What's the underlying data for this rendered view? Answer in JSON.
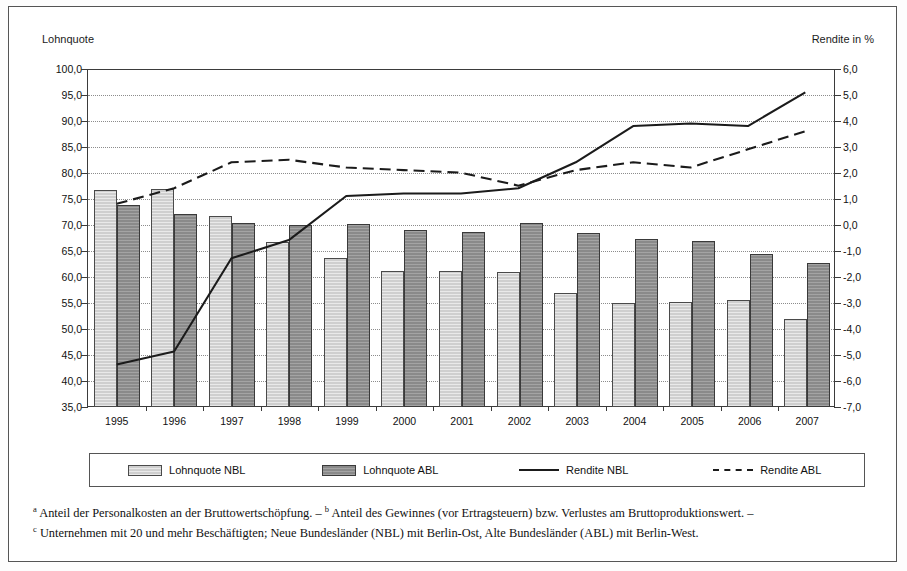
{
  "axis_captions": {
    "left": "Lohnquote",
    "right": "Rendite in %"
  },
  "legend": [
    {
      "label": "Lohnquote NBL",
      "swatch": "bar-light"
    },
    {
      "label": "Lohnquote ABL",
      "swatch": "bar-dark"
    },
    {
      "label": "Rendite NBL",
      "swatch": "line-solid"
    },
    {
      "label": "Rendite ABL",
      "swatch": "line-dashed"
    }
  ],
  "footnotes": [
    "a Anteil der Personalkosten an der Bruttowertschöpfung. – b Anteil des Gewinnes (vor Ertragsteuern) bzw. Verlustes am Bruttoproduktionswert. –",
    "c Unternehmen mit 20 und mehr Beschäftigten; Neue Bundesländer (NBL) mit Berlin-Ost, Alte Bundesländer (ABL) mit Berlin-West."
  ],
  "footnote_parts": [
    {
      "marker": "a",
      "text": " Anteil der Personalkosten an der Bruttowertschöpfung. – ",
      "marker2": "b",
      "text2": " Anteil des Gewinnes (vor Ertragsteuern) bzw. Verlustes am Bruttoproduktionswert. –"
    },
    {
      "marker": "c",
      "text": " Unternehmen mit 20 und mehr Beschäftigten; Neue Bundesländer (NBL) mit Berlin-Ost, Alte Bundesländer (ABL) mit Berlin-West."
    }
  ],
  "colors": {
    "bar_nbl": "#cfcfcf",
    "bar_abl": "#8a8a8a",
    "line": "#1b1b1b",
    "axis": "#3b3b3b",
    "grid": "#8c8c8c"
  },
  "chart_data": {
    "type": "bar",
    "title": "",
    "xlabel": "",
    "ylabel": "Lohnquote",
    "y2label": "Rendite in %",
    "grid": true,
    "legend_position": "bottom",
    "categories": [
      "1995",
      "1996",
      "1997",
      "1998",
      "1999",
      "2000",
      "2001",
      "2002",
      "2003",
      "2004",
      "2005",
      "2006",
      "2007"
    ],
    "ylim": [
      35.0,
      100.0
    ],
    "ytick_step": 5.0,
    "yticks": [
      "100,0",
      "95,0",
      "90,0",
      "85,0",
      "80,0",
      "75,0",
      "70,0",
      "65,0",
      "60,0",
      "55,0",
      "50,0",
      "45,0",
      "40,0",
      "35,0"
    ],
    "ytick_values": [
      100.0,
      95.0,
      90.0,
      85.0,
      80.0,
      75.0,
      70.0,
      65.0,
      60.0,
      55.0,
      50.0,
      45.0,
      40.0,
      35.0
    ],
    "y2lim": [
      -7.0,
      6.0
    ],
    "y2tick_step": 1.0,
    "y2ticks": [
      "6,0",
      "5,0",
      "4,0",
      "3,0",
      "2,0",
      "1,0",
      "0,0",
      "-1,0",
      "-2,0",
      "-3,0",
      "-4,0",
      "-5,0",
      "-6,0",
      "-7,0"
    ],
    "y2tick_values": [
      6.0,
      5.0,
      4.0,
      3.0,
      2.0,
      1.0,
      0.0,
      -1.0,
      -2.0,
      -3.0,
      -4.0,
      -5.0,
      -6.0,
      -7.0
    ],
    "series": [
      {
        "name": "Lohnquote NBL",
        "kind": "bar",
        "axis": "left",
        "values": [
          76.8,
          77.0,
          71.8,
          66.8,
          63.6,
          61.1,
          61.1,
          60.9,
          57.0,
          55.0,
          55.2,
          55.6,
          52.0
        ]
      },
      {
        "name": "Lohnquote ABL",
        "kind": "bar",
        "axis": "left",
        "values": [
          73.9,
          72.1,
          70.4,
          70.0,
          70.2,
          69.0,
          68.6,
          70.3,
          68.4,
          67.3,
          66.9,
          64.4,
          62.6
        ]
      },
      {
        "name": "Rendite NBL",
        "kind": "line",
        "style": "solid",
        "axis": "right",
        "values": [
          -5.4,
          -4.9,
          -1.3,
          -0.6,
          1.1,
          1.2,
          1.2,
          1.4,
          2.4,
          3.8,
          3.9,
          3.8,
          5.1
        ]
      },
      {
        "name": "Rendite ABL",
        "kind": "line",
        "style": "dashed",
        "axis": "right",
        "values": [
          0.8,
          1.4,
          2.4,
          2.5,
          2.2,
          2.1,
          2.0,
          1.5,
          2.1,
          2.4,
          2.2,
          2.9,
          3.6
        ]
      }
    ]
  }
}
